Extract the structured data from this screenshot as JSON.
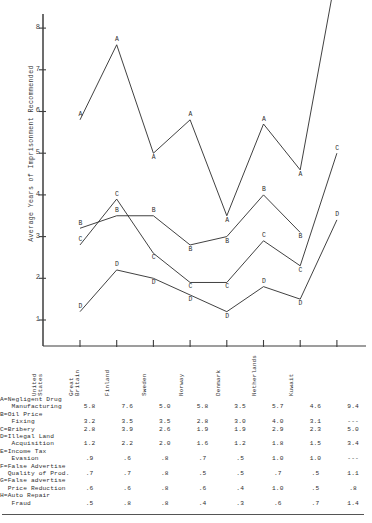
{
  "chart_data": {
    "type": "line",
    "title": "",
    "xlabel": "",
    "ylabel": "Average Years of Imprisonment Recommended",
    "ylim": [
      0,
      8.4
    ],
    "yticks": [
      1,
      2,
      3,
      4,
      5,
      6,
      7,
      8
    ],
    "grid": false,
    "legend": "inline-point-labels",
    "categories": [
      "United States",
      "Great Britain",
      "Finland",
      "Sweden",
      "Norway",
      "Denmark",
      "Netherlands",
      "Kuwait"
    ],
    "series": [
      {
        "name": "A",
        "label": "A=Negligent Drug Manufacturing",
        "values": [
          5.8,
          7.6,
          5.0,
          5.8,
          3.5,
          5.7,
          4.6,
          9.4
        ]
      },
      {
        "name": "B",
        "label": "B=Oil Price Fixing",
        "values": [
          3.2,
          3.5,
          3.5,
          2.8,
          3.0,
          4.0,
          3.1,
          null
        ]
      },
      {
        "name": "C",
        "label": "C=Bribery",
        "values": [
          2.8,
          3.9,
          2.6,
          1.9,
          1.9,
          2.9,
          2.3,
          5.0
        ]
      },
      {
        "name": "D",
        "label": "D=Illegal Land Acquisition",
        "values": [
          1.2,
          2.2,
          2.0,
          1.6,
          1.2,
          1.8,
          1.5,
          3.4
        ]
      },
      {
        "name": "E",
        "label": "E=Income Tax Evasion",
        "values": [
          0.9,
          0.6,
          0.8,
          0.7,
          0.5,
          1.0,
          1.0,
          null
        ]
      },
      {
        "name": "F",
        "label": "F=False Advertise Quality of Prod.",
        "values": [
          0.7,
          0.7,
          0.8,
          0.5,
          0.5,
          0.7,
          0.5,
          1.1
        ]
      },
      {
        "name": "G",
        "label": "G=False advertise Price Reduction",
        "values": [
          0.6,
          0.6,
          0.8,
          0.6,
          0.4,
          1.0,
          0.5,
          0.8
        ]
      },
      {
        "name": "H",
        "label": "H=Auto Repair Fraud",
        "values": [
          0.5,
          0.8,
          0.8,
          0.4,
          0.3,
          0.6,
          0.7,
          1.4
        ]
      }
    ],
    "plotted_series": [
      "A",
      "B",
      "C",
      "D"
    ]
  },
  "axis": {
    "title": "Average Years of Imprisonment Recommended",
    "tick_1": "1",
    "tick_2": "2",
    "tick_3": "3",
    "tick_4": "4",
    "tick_5": "5",
    "tick_6": "6",
    "tick_7": "7",
    "tick_8": "8"
  },
  "table": {
    "columns": [
      {
        "line1": "United",
        "line2": "States"
      },
      {
        "line1": "Great",
        "line2": "Britain"
      },
      {
        "line1": "Finland",
        "line2": ""
      },
      {
        "line1": "Sweden",
        "line2": ""
      },
      {
        "line1": "Norway",
        "line2": ""
      },
      {
        "line1": "Denmark",
        "line2": ""
      },
      {
        "line1": "Netherlands",
        "line2": ""
      },
      {
        "line1": "Kuwait",
        "line2": ""
      }
    ],
    "rows": [
      {
        "label": "A=Negligent Drug\n   Manufacturing",
        "cells": [
          "5.8",
          "7.6",
          "5.0",
          "5.8",
          "3.5",
          "5.7",
          "4.6",
          "9.4"
        ]
      },
      {
        "label": "B=Oil Price\n   Fixing",
        "cells": [
          "3.2",
          "3.5",
          "3.5",
          "2.8",
          "3.0",
          "4.0",
          "3.1",
          "---"
        ]
      },
      {
        "label": "C=Bribery",
        "cells": [
          "2.8",
          "3.9",
          "2.6",
          "1.9",
          "1.9",
          "2.9",
          "2.3",
          "5.0"
        ]
      },
      {
        "label": "D=Illegal Land\n   Acquisition",
        "cells": [
          "1.2",
          "2.2",
          "2.0",
          "1.6",
          "1.2",
          "1.8",
          "1.5",
          "3.4"
        ]
      },
      {
        "label": "E=Income Tax\n   Evasion",
        "cells": [
          ".9",
          ".6",
          ".8",
          ".7",
          ".5",
          "1.0",
          "1.0",
          "---"
        ]
      },
      {
        "label": "F=False Advertise\n  Quality of Prod.",
        "cells": [
          ".7",
          ".7",
          ".8",
          ".5",
          ".5",
          ".7",
          ".5",
          "1.1"
        ]
      },
      {
        "label": "G=False advertise\n  Price Reduction",
        "cells": [
          ".6",
          ".6",
          ".8",
          ".6",
          ".4",
          "1.0",
          ".5",
          ".8"
        ]
      },
      {
        "label": "H=Auto Repair\n   Fraud",
        "cells": [
          ".5",
          ".8",
          ".8",
          ".4",
          ".3",
          ".6",
          ".7",
          "1.4"
        ]
      }
    ]
  },
  "colors": {
    "ink": "#2b2b2b",
    "axis": "#444444",
    "background": "#ffffff"
  }
}
